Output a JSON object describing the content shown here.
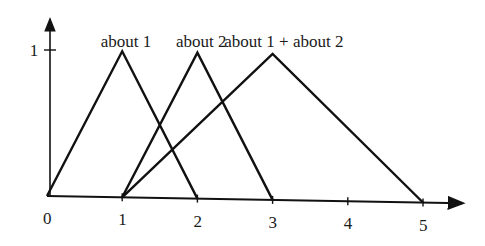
{
  "chart_data": {
    "type": "line",
    "title": "",
    "xlabel": "",
    "ylabel": "",
    "xlim": [
      0,
      5.5
    ],
    "ylim": [
      0,
      1.1
    ],
    "grid": false,
    "legend": "inline labels above peaks",
    "x_ticks": [
      {
        "value": 0,
        "label": "0"
      },
      {
        "value": 1,
        "label": "1"
      },
      {
        "value": 2,
        "label": "2"
      },
      {
        "value": 3,
        "label": "3"
      },
      {
        "value": 4,
        "label": "4"
      },
      {
        "value": 5,
        "label": "5"
      }
    ],
    "y_ticks": [
      {
        "value": 1,
        "label": "1"
      }
    ],
    "series": [
      {
        "name": "about 1",
        "x": [
          0,
          1,
          2
        ],
        "y": [
          0,
          1,
          0
        ],
        "label_pos": [
          1.05,
          1.08
        ]
      },
      {
        "name": "about 2",
        "x": [
          1,
          2,
          3
        ],
        "y": [
          0,
          1,
          0
        ],
        "label_pos": [
          2.05,
          1.08
        ]
      },
      {
        "name": "about 1 + about 2",
        "x": [
          1,
          3,
          5
        ],
        "y": [
          0,
          1,
          0
        ],
        "label_pos": [
          3.15,
          1.08
        ]
      }
    ]
  },
  "layout": {
    "origin_px": [
      47,
      196
    ],
    "x_unit_px": 75.2,
    "y_unit_px": 146,
    "x_axis_end_px": 462,
    "y_axis_top_px": 20,
    "baseline_tilt_px_per_unit": 1.3,
    "line_color": "#111111"
  }
}
